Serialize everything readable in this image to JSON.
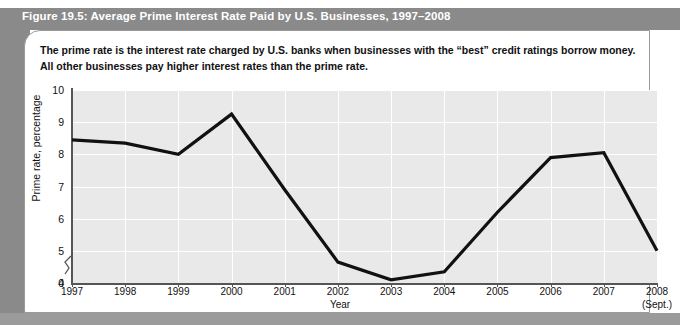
{
  "figure": {
    "title": "Figure 19.5: Average Prime Interest Rate Paid by U.S. Businesses, 1997–2008",
    "caption": "The prime rate is the interest rate charged by U.S. banks when businesses with the “best” credit ratings borrow money. All other businesses pay higher interest rates than the prime rate."
  },
  "colors": {
    "header_band": "#8a8a8a",
    "title_text": "#ffffff",
    "plot_background": "#e9e9e9",
    "gridline": "#ffffff",
    "series_line": "#111111",
    "axis": "#555555",
    "card_background": "#ffffff"
  },
  "chart_data": {
    "type": "line",
    "title": "Average Prime Interest Rate Paid by U.S. Businesses, 1997–2008",
    "xlabel": "Year",
    "ylabel": "Prime rate, percentage",
    "categories": [
      "1997",
      "1998",
      "1999",
      "2000",
      "2001",
      "2002",
      "2003",
      "2004",
      "2005",
      "2006",
      "2007",
      "2008"
    ],
    "x_sublabels": [
      "",
      "",
      "",
      "",
      "",
      "",
      "",
      "",
      "",
      "",
      "",
      "(Sept.)"
    ],
    "values": [
      8.45,
      8.35,
      8.0,
      9.25,
      6.9,
      4.65,
      4.1,
      4.35,
      6.2,
      7.9,
      8.05,
      5.0
    ],
    "series": [
      {
        "name": "Prime rate",
        "values": [
          8.45,
          8.35,
          8.0,
          9.25,
          6.9,
          4.65,
          4.1,
          4.35,
          6.2,
          7.9,
          8.05,
          5.0
        ]
      }
    ],
    "ylim": [
      4,
      10
    ],
    "y_ticks": [
      4,
      5,
      6,
      7,
      8,
      9,
      10
    ],
    "y_extra_tick": 0,
    "y_axis_break": true,
    "grid": true,
    "legend": "none"
  }
}
